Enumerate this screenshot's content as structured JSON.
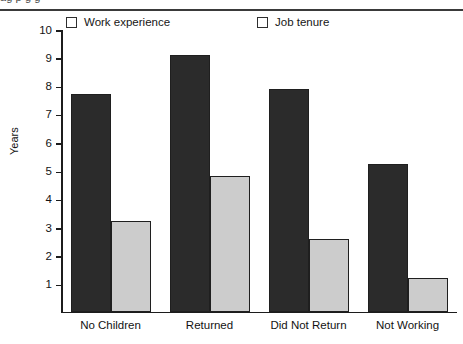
{
  "top_clipped_text": "ag p g g",
  "chart_data": {
    "type": "bar",
    "title": "",
    "xlabel": "",
    "ylabel": "Years",
    "ylim": [
      0,
      10
    ],
    "yticks": [
      10,
      9,
      8,
      7,
      6,
      5,
      4,
      3,
      2,
      1
    ],
    "ytick_labels": [
      "10",
      "9",
      "8",
      "7",
      "6",
      "5",
      "4",
      "3",
      "2",
      "1"
    ],
    "grid": false,
    "legend_position": "top",
    "categories": [
      "No Children",
      "Returned",
      "Did Not Return",
      "Not Working"
    ],
    "series": [
      {
        "name": "Work experience",
        "color": "#2b2b2b",
        "values": [
          7.7,
          9.05,
          7.85,
          5.2
        ]
      },
      {
        "name": "Job tenure",
        "color": "#cccccc",
        "values": [
          3.2,
          4.8,
          2.55,
          1.2
        ]
      }
    ]
  }
}
